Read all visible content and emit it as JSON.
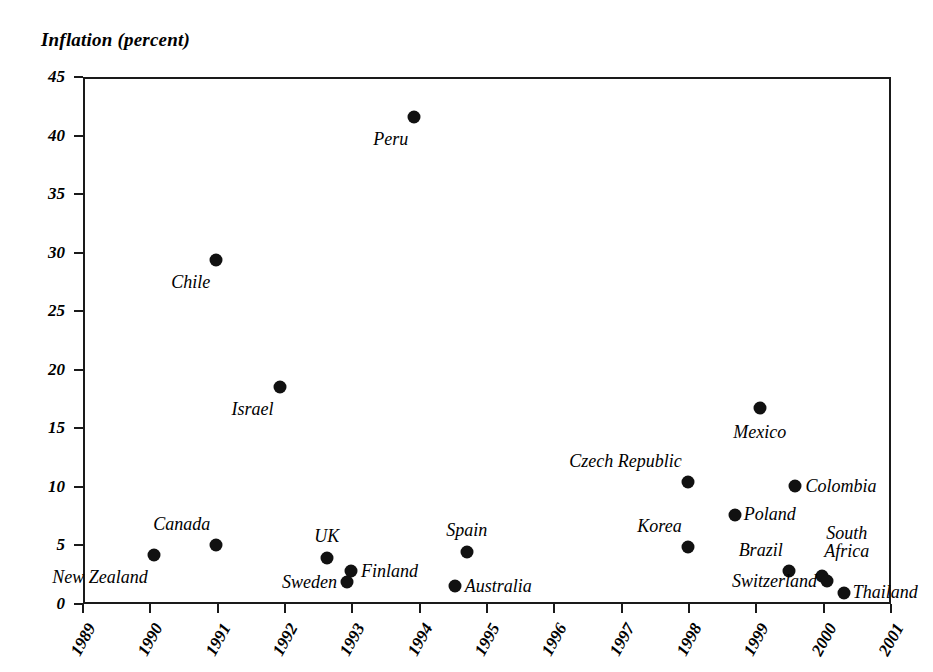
{
  "chart_data": {
    "type": "scatter",
    "title": "Inflation (percent)",
    "xlabel": "",
    "ylabel": "Inflation (percent)",
    "xlim": [
      1989,
      2001
    ],
    "ylim": [
      0,
      45
    ],
    "grid": false,
    "legend": "none",
    "x_ticks": [
      "1989",
      "1990",
      "1991",
      "1992",
      "1993",
      "1994",
      "1995",
      "1996",
      "1997",
      "1998",
      "1999",
      "2000",
      "2001"
    ],
    "y_ticks": [
      "0",
      "5",
      "10",
      "15",
      "20",
      "25",
      "30",
      "35",
      "40",
      "45"
    ],
    "marker_color": "#111111",
    "axis_color": "#1a1a1a",
    "points": [
      {
        "label": "New Zealand",
        "x": 1990.05,
        "y": 4.2,
        "label_pos": "below-left"
      },
      {
        "label": "Canada",
        "x": 1990.98,
        "y": 5.0,
        "label_pos": "above-left"
      },
      {
        "label": "Chile",
        "x": 1990.98,
        "y": 29.4,
        "label_pos": "below-left"
      },
      {
        "label": "Israel",
        "x": 1991.92,
        "y": 18.5,
        "label_pos": "below-left"
      },
      {
        "label": "UK",
        "x": 1992.62,
        "y": 3.9,
        "label_pos": "above-center"
      },
      {
        "label": "Finland",
        "x": 1992.98,
        "y": 2.8,
        "label_pos": "right"
      },
      {
        "label": "Sweden",
        "x": 1992.92,
        "y": 1.9,
        "label_pos": "left"
      },
      {
        "label": "Peru",
        "x": 1993.92,
        "y": 41.6,
        "label_pos": "below-left"
      },
      {
        "label": "Australia",
        "x": 1994.52,
        "y": 1.5,
        "label_pos": "right"
      },
      {
        "label": "Spain",
        "x": 1994.7,
        "y": 4.4,
        "label_pos": "above-center"
      },
      {
        "label": "Korea",
        "x": 1997.98,
        "y": 4.9,
        "label_pos": "above-left"
      },
      {
        "label": "Czech Republic",
        "x": 1997.98,
        "y": 10.4,
        "label_pos": "above-left"
      },
      {
        "label": "Poland",
        "x": 1998.68,
        "y": 7.6,
        "label_pos": "above-right"
      },
      {
        "label": "Mexico",
        "x": 1999.05,
        "y": 16.7,
        "label_pos": "below-center"
      },
      {
        "label": "Colombia",
        "x": 1999.58,
        "y": 10.1,
        "label_pos": "right"
      },
      {
        "label": "Brazil",
        "x": 1999.48,
        "y": 2.8,
        "label_pos": "above-left"
      },
      {
        "label": "South Africa",
        "x": 1999.98,
        "y": 2.4,
        "label_pos": "above-right-two-line"
      },
      {
        "label": "Switzerland",
        "x": 2000.05,
        "y": 2.0,
        "label_pos": "left"
      },
      {
        "label": "Thailand",
        "x": 2000.3,
        "y": 0.9,
        "label_pos": "above-right"
      }
    ]
  }
}
